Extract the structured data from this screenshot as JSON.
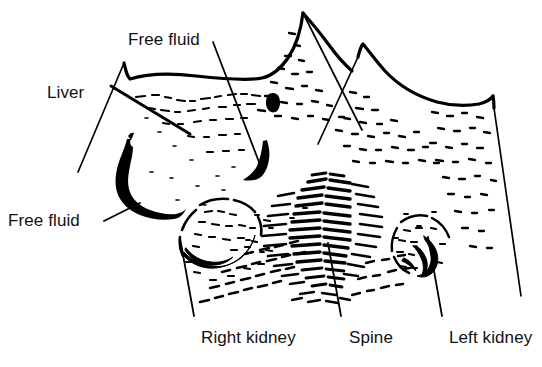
{
  "figure": {
    "type": "ultrasound-line-drawing",
    "modality": "abdominal ultrasound schematic",
    "background_color": "#ffffff",
    "ink_color": "#000000",
    "width": 542,
    "height": 367
  },
  "labels": [
    {
      "id": "free-fluid-top",
      "text": "Free fluid",
      "x": 128,
      "y": 30,
      "anchor": "start"
    },
    {
      "id": "liver",
      "text": "Liver",
      "x": 47,
      "y": 83,
      "anchor": "start"
    },
    {
      "id": "free-fluid-left",
      "text": "Free fluid",
      "x": 8,
      "y": 211,
      "anchor": "start"
    },
    {
      "id": "right-kidney",
      "text": "Right kidney",
      "x": 201,
      "y": 328,
      "anchor": "start"
    },
    {
      "id": "spine",
      "text": "Spine",
      "x": 349,
      "y": 328,
      "anchor": "start"
    },
    {
      "id": "left-kidney",
      "text": "Left kidney",
      "x": 449,
      "y": 328,
      "anchor": "start"
    }
  ],
  "leaders": [
    {
      "id": "leader-free-fluid-top",
      "from": [
        213,
        42
      ],
      "to": [
        259,
        162
      ]
    },
    {
      "id": "leader-liver",
      "from": [
        111,
        86
      ],
      "to": [
        190,
        134
      ]
    },
    {
      "id": "leader-free-fluid-left",
      "from": [
        104,
        221
      ],
      "to": [
        140,
        203
      ]
    },
    {
      "id": "leader-right-kidney",
      "from": [
        194,
        316
      ],
      "to": [
        180,
        238
      ]
    },
    {
      "id": "leader-spine",
      "from": [
        341,
        316
      ],
      "to": [
        328,
        243
      ]
    },
    {
      "id": "leader-left-kidney",
      "from": [
        442,
        316
      ],
      "to": [
        428,
        237
      ]
    }
  ],
  "anatomy": {
    "skin_line_label": "body surface contour",
    "left_sector_edge_label": "left scan sector edge",
    "right_sector_edge_label": "right scan sector edge",
    "free_fluid_band_label": "free fluid anechoic band",
    "free_fluid_wedge_label": "free fluid wedge",
    "right_kidney_label": "right kidney speckle region",
    "left_kidney_label": "left kidney speckle region",
    "spine_label": "spine acoustic shadow speckle",
    "parenchyma_label": "parenchymal speckle texture"
  }
}
